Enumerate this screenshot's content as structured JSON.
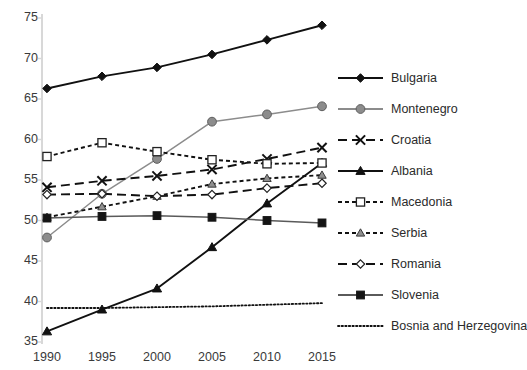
{
  "chart_data": {
    "type": "line",
    "title": "",
    "xlabel": "",
    "ylabel": "",
    "x": [
      1990,
      1995,
      2000,
      2005,
      2010,
      2015
    ],
    "categories": [
      "1990",
      "1995",
      "2000",
      "2005",
      "2010",
      "2015"
    ],
    "xlim": [
      1990,
      2015
    ],
    "ylim": [
      35,
      75
    ],
    "yticks": [
      35,
      40,
      45,
      50,
      55,
      60,
      65,
      70,
      75
    ],
    "ytick_labels": [
      "35",
      "40",
      "45",
      "50",
      "55",
      "60",
      "65",
      "70",
      "75"
    ],
    "grid": false,
    "legend_position": "right",
    "series": [
      {
        "name": "Bulgaria",
        "values": [
          66.3,
          67.8,
          68.9,
          70.5,
          72.3,
          74.1
        ],
        "marker": "diamond",
        "color": "#111111",
        "line": "solid"
      },
      {
        "name": "Montenegro",
        "values": [
          47.9,
          53.3,
          57.6,
          62.2,
          63.1,
          64.1
        ],
        "marker": "circle",
        "color": "#8c8c8c",
        "line": "solid"
      },
      {
        "name": "Croatia",
        "values": [
          54.1,
          54.9,
          55.5,
          56.3,
          57.6,
          59.0
        ],
        "marker": "cross",
        "color": "#111111",
        "line": "dashed"
      },
      {
        "name": "Albania",
        "values": [
          36.3,
          39.0,
          41.6,
          46.7,
          52.1,
          57.1
        ],
        "marker": "triangle",
        "color": "#111111",
        "line": "solid"
      },
      {
        "name": "Macedonia",
        "values": [
          57.9,
          59.6,
          58.5,
          57.5,
          57.0,
          57.1
        ],
        "marker": "square-open",
        "color": "#111111",
        "line": "dashed-small"
      },
      {
        "name": "Serbia",
        "values": [
          50.4,
          51.7,
          53.0,
          54.5,
          55.2,
          55.6
        ],
        "marker": "triangle-gray",
        "color": "#111111",
        "line": "dashed-small"
      },
      {
        "name": "Romania",
        "values": [
          53.2,
          53.3,
          53.0,
          53.2,
          54.0,
          54.6
        ],
        "marker": "diamond-open",
        "color": "#111111",
        "line": "dashed"
      },
      {
        "name": "Slovenia",
        "values": [
          50.3,
          50.5,
          50.6,
          50.4,
          50.0,
          49.7
        ],
        "marker": "square",
        "color": "#5a5a5a",
        "line": "solid"
      },
      {
        "name": "Bosnia and Herzegovina",
        "values": [
          39.2,
          39.2,
          39.3,
          39.4,
          39.6,
          39.8
        ],
        "marker": "none",
        "color": "#111111",
        "line": "dotted"
      }
    ]
  },
  "legend": {
    "items": [
      {
        "label": "Bulgaria"
      },
      {
        "label": "Montenegro"
      },
      {
        "label": "Croatia"
      },
      {
        "label": "Albania"
      },
      {
        "label": "Macedonia"
      },
      {
        "label": "Serbia"
      },
      {
        "label": "Romania"
      },
      {
        "label": "Slovenia"
      },
      {
        "label": "Bosnia and Herzegovina"
      }
    ]
  },
  "axes": {
    "y_axis_name": "value-axis",
    "x_axis_name": "year-axis"
  }
}
